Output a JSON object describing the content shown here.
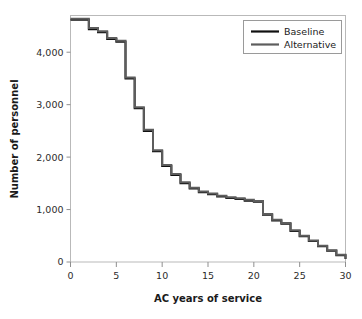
{
  "chart_data": {
    "type": "line",
    "subtype": "step",
    "title": "",
    "xlabel": "AC years of service",
    "ylabel": "Number of personnel",
    "xlim": [
      0,
      30
    ],
    "ylim": [
      0,
      4700
    ],
    "xticks": [
      0,
      5,
      10,
      15,
      20,
      25,
      30
    ],
    "xticklabels": [
      "0",
      "5",
      "10",
      "15",
      "20",
      "25",
      "30"
    ],
    "yticks": [
      0,
      1000,
      2000,
      3000,
      4000
    ],
    "yticklabels": [
      "0",
      "1,000",
      "2,000",
      "3,000",
      "4,000"
    ],
    "grid": false,
    "legend_position": "upper right",
    "x": [
      0,
      1,
      2,
      3,
      4,
      5,
      6,
      7,
      8,
      9,
      10,
      11,
      12,
      13,
      14,
      15,
      16,
      17,
      18,
      19,
      20,
      21,
      22,
      23,
      24,
      25,
      26,
      27,
      28,
      29,
      30
    ],
    "series": [
      {
        "name": "Baseline",
        "color": "#101010",
        "values": [
          4620,
          4620,
          4440,
          4380,
          4250,
          4200,
          3500,
          2930,
          2500,
          2110,
          1830,
          1660,
          1500,
          1400,
          1330,
          1290,
          1250,
          1220,
          1200,
          1170,
          1150,
          900,
          790,
          730,
          590,
          490,
          400,
          300,
          215,
          130,
          55
        ]
      },
      {
        "name": "Alternative",
        "color": "#5d5d5d",
        "values": [
          4640,
          4640,
          4460,
          4400,
          4270,
          4220,
          3520,
          2950,
          2520,
          2130,
          1850,
          1680,
          1520,
          1415,
          1345,
          1305,
          1265,
          1235,
          1215,
          1185,
          1165,
          915,
          805,
          745,
          605,
          500,
          410,
          308,
          222,
          136,
          60
        ]
      }
    ]
  },
  "legend": {
    "items": [
      {
        "label": "Baseline",
        "color": "#101010"
      },
      {
        "label": "Alternative",
        "color": "#5d5d5d"
      }
    ]
  },
  "axes": {
    "x_title": "AC years of service",
    "y_title": "Number of personnel"
  }
}
